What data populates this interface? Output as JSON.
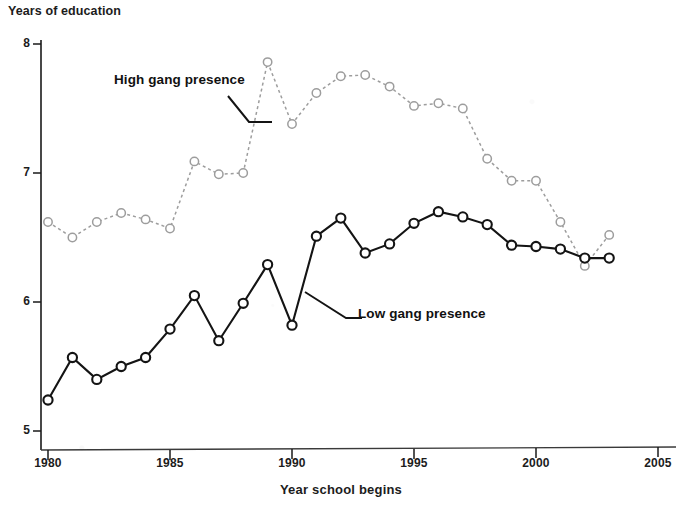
{
  "chart_data": {
    "type": "line",
    "title": "",
    "ylabel": "Years of education",
    "xlabel": "Year school begins",
    "xlim": [
      1980,
      2005
    ],
    "ylim": [
      5,
      8
    ],
    "grid": false,
    "legend_position": "inline-annotations",
    "xticks": [
      1980,
      1985,
      1990,
      1995,
      2000,
      2005
    ],
    "yticks": [
      5,
      6,
      7,
      8
    ],
    "x": [
      1980,
      1981,
      1982,
      1983,
      1984,
      1985,
      1986,
      1987,
      1988,
      1989,
      1990,
      1991,
      1992,
      1993,
      1994,
      1995,
      1996,
      1997,
      1998,
      1999,
      2000,
      2001,
      2002,
      2003
    ],
    "series": [
      {
        "name": "High gang presence",
        "style": "dotted",
        "marker": "open-circle",
        "color": "#9a9a9a",
        "values": [
          6.62,
          6.5,
          6.62,
          6.69,
          6.64,
          6.57,
          7.09,
          6.99,
          7.0,
          7.86,
          7.38,
          7.62,
          7.75,
          7.76,
          7.67,
          7.52,
          7.54,
          7.5,
          7.11,
          6.94,
          6.94,
          6.62,
          6.28,
          6.52
        ]
      },
      {
        "name": "Low gang presence",
        "style": "solid",
        "marker": "open-circle",
        "color": "#1a1a1a",
        "values": [
          5.24,
          5.57,
          5.4,
          5.5,
          5.57,
          5.79,
          6.05,
          5.7,
          5.99,
          6.29,
          5.82,
          6.51,
          6.65,
          6.38,
          6.45,
          6.61,
          6.7,
          6.66,
          6.6,
          6.44,
          6.43,
          6.41,
          6.34,
          6.34
        ]
      }
    ],
    "annotations": [
      {
        "text": "High gang presence",
        "x_px": 114,
        "y_px": 80
      },
      {
        "text": "Low gang presence",
        "x_px": 358,
        "y_px": 314
      }
    ]
  },
  "axis": {
    "y_title": "Years of education",
    "x_title": "Year school begins",
    "y_ticks": [
      "8",
      "7",
      "6",
      "5"
    ],
    "x_ticks": [
      "1980",
      "1985",
      "1990",
      "1995",
      "2000",
      "2005"
    ]
  },
  "labels": {
    "high": "High gang presence",
    "low": "Low gang presence"
  }
}
